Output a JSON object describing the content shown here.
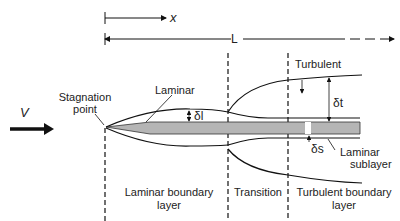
{
  "axis": {
    "x_label": "x",
    "L_label": "L"
  },
  "flow": {
    "velocity_label": "V"
  },
  "labels": {
    "stagnation_line1": "Stagnation",
    "stagnation_line2": "point",
    "laminar": "Laminar",
    "turbulent": "Turbulent",
    "delta_l": "δl",
    "delta_t": "δt",
    "delta_s": "δs",
    "sublayer_line1": "Laminar",
    "sublayer_line2": "sublayer"
  },
  "regions": {
    "laminar_bl_line1": "Laminar boundary",
    "laminar_bl_line2": "layer",
    "transition": "Transition",
    "turbulent_bl_line1": "Turbulent boundary",
    "turbulent_bl_line2": "layer"
  },
  "colors": {
    "plate": "#b5b5b5",
    "line": "#111111",
    "background": "#ffffff"
  }
}
